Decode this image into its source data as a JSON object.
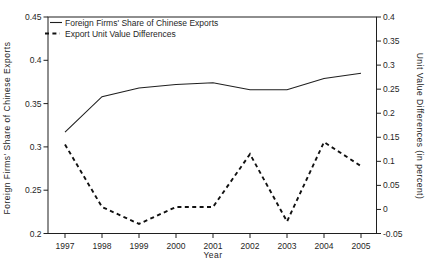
{
  "chart_data": {
    "type": "line",
    "x": [
      1997,
      1998,
      1999,
      2000,
      2001,
      2002,
      2003,
      2004,
      2005
    ],
    "series": [
      {
        "name": "Foreign Firms' Share of Chinese Exports",
        "axis": "left",
        "style": "solid",
        "values": [
          0.317,
          0.358,
          0.368,
          0.372,
          0.374,
          0.366,
          0.366,
          0.379,
          0.385
        ]
      },
      {
        "name": "Export Unit Value Differences",
        "axis": "right",
        "style": "dashed",
        "values": [
          0.135,
          0.005,
          -0.03,
          0.005,
          0.005,
          0.115,
          -0.025,
          0.14,
          0.09
        ]
      }
    ],
    "title": "",
    "xlabel": "Year",
    "ylabel_left": "Foreign Firms' Share of Chinese Exports",
    "ylabel_right": "Unit Value Differences (in percent)",
    "ylim_left": [
      0.2,
      0.45
    ],
    "ylim_right": [
      -0.05,
      0.4
    ],
    "yticks_left": [
      0.45,
      0.4,
      0.35,
      0.3,
      0.25,
      0.2
    ],
    "yticks_right": [
      0.4,
      0.35,
      0.3,
      0.25,
      0.2,
      0.15,
      0.1,
      0.05,
      0,
      -0.05
    ],
    "grid": false,
    "legend_position": "top-left-inside",
    "colors": {
      "line": "#1f1f1f",
      "background": "#ffffff"
    }
  }
}
